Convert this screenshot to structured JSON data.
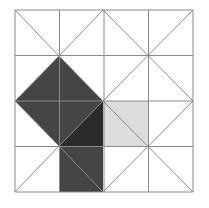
{
  "diagram": {
    "type": "grid-tiling",
    "grid": {
      "cols": 4,
      "rows": 4,
      "x0": 15,
      "y0": 10,
      "x1": 193,
      "y1": 192
    },
    "colors": {
      "background": "#ffffff",
      "grid_line": "#8a8a8a",
      "dark_region": "#454545",
      "darker_triangle": "#2b2b2b",
      "light_square": "#dcdcdc"
    },
    "shapes": [
      {
        "name": "dark-tilted-square",
        "points": "59,56 103,101 59,146 15,101"
      },
      {
        "name": "dark-lower-square",
        "points": "59,146 103,146 103,192 59,192"
      },
      {
        "name": "dark-mid-triangle",
        "points": "59,101 103,101 59,146"
      },
      {
        "name": "darker-triangle",
        "points": "59,146 103,101 103,146"
      },
      {
        "name": "light-square",
        "points": "103,101 148,101 148,146 103,146"
      }
    ],
    "diagonals": [
      {
        "x1": 15,
        "y1": 10,
        "x2": 59,
        "y2": 56
      },
      {
        "x1": 59,
        "y1": 56,
        "x2": 103,
        "y2": 10
      },
      {
        "x1": 103,
        "y1": 10,
        "x2": 193,
        "y2": 101
      },
      {
        "x1": 193,
        "y1": 10,
        "x2": 103,
        "y2": 101
      },
      {
        "x1": 15,
        "y1": 101,
        "x2": 59,
        "y2": 56
      },
      {
        "x1": 59,
        "y1": 56,
        "x2": 103,
        "y2": 101
      },
      {
        "x1": 15,
        "y1": 101,
        "x2": 59,
        "y2": 146
      },
      {
        "x1": 59,
        "y1": 146,
        "x2": 103,
        "y2": 101
      },
      {
        "x1": 15,
        "y1": 192,
        "x2": 59,
        "y2": 146
      },
      {
        "x1": 59,
        "y1": 146,
        "x2": 103,
        "y2": 192
      },
      {
        "x1": 103,
        "y1": 101,
        "x2": 193,
        "y2": 192
      },
      {
        "x1": 103,
        "y1": 192,
        "x2": 193,
        "y2": 101
      }
    ]
  }
}
